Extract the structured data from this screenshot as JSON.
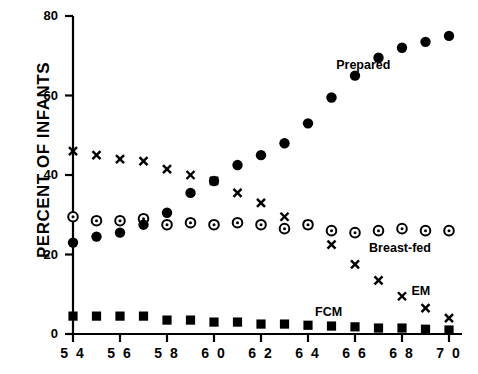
{
  "chart_data": {
    "type": "scatter",
    "title": "",
    "xlabel": "",
    "ylabel": "PERCENT OF INFANTS",
    "xlim": [
      53.2,
      70.6
    ],
    "ylim": [
      0,
      80
    ],
    "grid": false,
    "legend_position": "inline-annotations",
    "x_tick_labels": [
      "5 4",
      "5 6",
      "5 8",
      "6 0",
      "6 2",
      "6 4",
      "6 6",
      "6 8",
      "7 0"
    ],
    "x_ticks": [
      54,
      56,
      58,
      60,
      62,
      64,
      66,
      68,
      70
    ],
    "y_tick_labels": [
      "0",
      "20",
      "40",
      "60",
      "80"
    ],
    "y_ticks": [
      0,
      20,
      40,
      60,
      80
    ],
    "x": [
      54,
      55,
      56,
      57,
      58,
      59,
      60,
      61,
      62,
      63,
      64,
      65,
      66,
      67,
      68,
      69,
      70
    ],
    "series": [
      {
        "name": "Prepared",
        "marker": "filled-circle",
        "color": "#000000",
        "label_x": 65.2,
        "label_y": 67.5,
        "values": [
          23.0,
          24.5,
          25.5,
          27.5,
          30.5,
          35.5,
          38.5,
          42.5,
          45.0,
          48.0,
          53.0,
          59.5,
          65.0,
          69.5,
          72.0,
          73.5,
          75.0
        ]
      },
      {
        "name": "Breast-fed",
        "marker": "circle-dot",
        "color": "#000000",
        "label_x": 66.6,
        "label_y": 21.5,
        "values": [
          29.5,
          28.5,
          28.5,
          29.0,
          27.5,
          28.0,
          27.5,
          28.0,
          27.5,
          26.5,
          27.5,
          26.0,
          25.5,
          26.0,
          26.5,
          26.0,
          26.0
        ]
      },
      {
        "name": "EM",
        "marker": "x",
        "color": "#000000",
        "label_x": 68.4,
        "label_y": 10.5,
        "values": [
          46.0,
          45.0,
          44.0,
          43.5,
          41.5,
          40.0,
          38.5,
          35.5,
          33.0,
          29.5,
          27.5,
          22.5,
          17.5,
          13.5,
          9.5,
          6.5,
          4.0
        ]
      },
      {
        "name": "FCM",
        "marker": "filled-square",
        "color": "#000000",
        "label_x": 64.3,
        "label_y": 5.2,
        "values": [
          4.5,
          4.5,
          4.5,
          4.5,
          3.5,
          3.5,
          3.0,
          3.0,
          2.5,
          2.5,
          2.2,
          2.0,
          1.8,
          1.5,
          1.5,
          1.2,
          1.0
        ]
      }
    ]
  }
}
